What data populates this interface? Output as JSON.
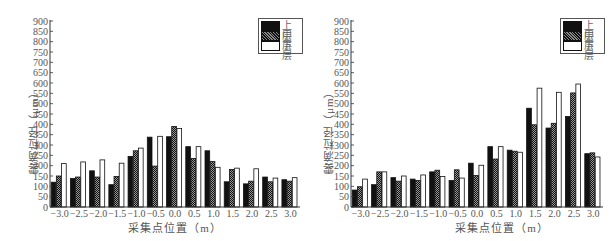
{
  "legend": {
    "items": [
      "上层",
      "中层",
      "下层"
    ]
  },
  "ylabel": "雾滴粒径（μm）",
  "xlabel": "采集点位置（m）",
  "colors": {
    "upper": "#111111",
    "middle": "hatched",
    "lower": "#ffffff",
    "axis": "#333333"
  },
  "chart_data": [
    {
      "type": "bar",
      "title": "",
      "xlabel": "采集点位置（m）",
      "ylabel": "雾滴粒径（μm）",
      "ylim": [
        0,
        900
      ],
      "yticks": [
        0,
        50,
        100,
        150,
        200,
        250,
        300,
        350,
        400,
        450,
        500,
        550,
        600,
        650,
        700,
        750,
        800,
        850,
        900
      ],
      "grid": false,
      "legend_position": "top-right",
      "categories": [
        "-3.0",
        "-2.5",
        "-2.0",
        "-1.5",
        "-1.0",
        "-0.5",
        "0.0",
        "0.5",
        "1.0",
        "1.5",
        "2.0",
        "2.5",
        "3.0"
      ],
      "series": [
        {
          "name": "上层",
          "values": [
            120,
            138,
            175,
            108,
            245,
            338,
            340,
            292,
            272,
            122,
            112,
            145,
            132
          ]
        },
        {
          "name": "中层",
          "values": [
            150,
            145,
            145,
            148,
            272,
            198,
            390,
            235,
            220,
            182,
            125,
            122,
            125
          ]
        },
        {
          "name": "下层",
          "values": [
            210,
            218,
            228,
            212,
            285,
            342,
            380,
            292,
            192,
            188,
            185,
            140,
            142
          ]
        }
      ]
    },
    {
      "type": "bar",
      "title": "",
      "xlabel": "采集点位置（m）",
      "ylabel": "雾滴粒径（μm）",
      "ylim": [
        0,
        900
      ],
      "yticks": [
        0,
        50,
        100,
        150,
        200,
        250,
        300,
        350,
        400,
        450,
        500,
        550,
        600,
        650,
        700,
        750,
        800,
        850,
        900
      ],
      "grid": false,
      "legend_position": "top-right",
      "categories": [
        "-3.0",
        "-2.5",
        "-2.0",
        "-1.5",
        "-1.0",
        "-0.5",
        "0.0",
        "0.5",
        "1.0",
        "1.5",
        "2.0",
        "2.5",
        "3.0"
      ],
      "series": [
        {
          "name": "上层",
          "values": [
            82,
            108,
            142,
            135,
            170,
            128,
            212,
            292,
            275,
            478,
            382,
            438,
            258
          ]
        },
        {
          "name": "中层",
          "values": [
            98,
            170,
            125,
            128,
            178,
            180,
            152,
            232,
            270,
            398,
            405,
            552,
            262
          ]
        },
        {
          "name": "下层",
          "values": [
            135,
            170,
            150,
            155,
            148,
            140,
            202,
            292,
            265,
            575,
            555,
            595,
            242
          ]
        }
      ]
    }
  ]
}
